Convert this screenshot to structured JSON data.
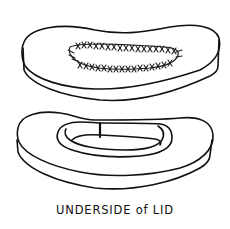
{
  "figure": {
    "caption": "UNDERSIDE of LID",
    "parts": [
      {
        "name": "lid-top-view",
        "description": "oval lid with stitched seam"
      },
      {
        "name": "lid-underside-view",
        "description": "lid underside showing inner rim with a notch"
      }
    ],
    "colors": {
      "ink": "#111111",
      "background": "#ffffff"
    }
  }
}
